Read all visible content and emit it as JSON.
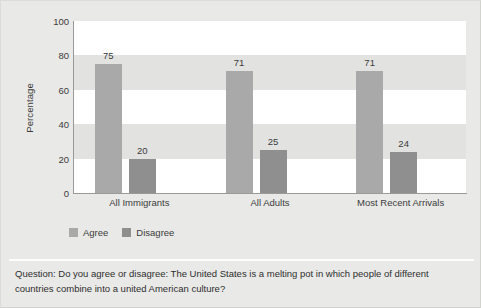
{
  "chart_data": {
    "type": "bar",
    "title": "",
    "subtitle": "",
    "xlabel": "",
    "ylabel": "Percentage",
    "ylim": [
      0,
      100
    ],
    "yticks": [
      0,
      20,
      40,
      60,
      80,
      100
    ],
    "ytick_labels": [
      "0",
      "20",
      "40",
      "60",
      "80",
      "100"
    ],
    "grid": "alternating horizontal bands",
    "legend_position": "below axis, left",
    "categories": [
      "All Immigrants",
      "All Adults",
      "Most Recent Arrivals"
    ],
    "series": [
      {
        "name": "Agree",
        "values": [
          75,
          71,
          71
        ],
        "color": "#a9a9a9"
      },
      {
        "name": "Disagree",
        "values": [
          20,
          25,
          24
        ],
        "color": "#8f8f8f"
      }
    ],
    "annotation": "Question: Do you agree or disagree: The United States is a melting pot in which people of different countries combine into a united American culture?"
  },
  "axis": {
    "y_title": "Percentage"
  },
  "legend": {
    "items": [
      {
        "label": "Agree",
        "color": "#a9a9a9"
      },
      {
        "label": "Disagree",
        "color": "#8f8f8f"
      }
    ]
  },
  "footer": {
    "line1": "Question: Do you agree or disagree: The United States is a melting pot in which people of different",
    "line2": "countries combine into a united American culture?"
  },
  "colors": {
    "background": "#e9e9e7",
    "plot_background": "#ffffff",
    "band_shaded": "#e2e2e0",
    "axis_line": "#9a9a98",
    "text": "#3b3b3b",
    "agree": "#a9a9a9",
    "disagree": "#8f8f8f",
    "divider": "#fdfdfd"
  }
}
